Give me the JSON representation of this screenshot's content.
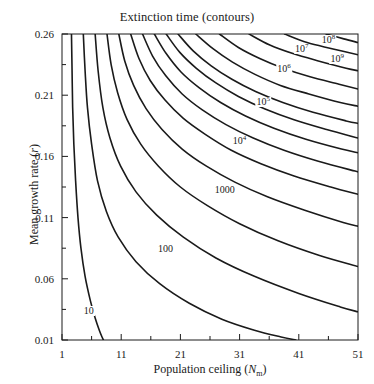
{
  "chart_data": {
    "type": "line",
    "title": "Extinction time (contours)",
    "xlabel": "Population ceiling (Nm)",
    "ylabel": "Mean growth rate (r)",
    "xlim": [
      1,
      51
    ],
    "ylim": [
      0.01,
      0.26
    ],
    "grid": false,
    "legend": "none",
    "xticks": [
      "1",
      "11",
      "21",
      "31",
      "41",
      "51"
    ],
    "xtick_values": [
      1,
      11,
      21,
      31,
      41,
      51
    ],
    "xminor_values": [
      6,
      16,
      26,
      36,
      46
    ],
    "yticks": [
      "0.01",
      "0.06",
      "0.11",
      "0.16",
      "0.21",
      "0.26"
    ],
    "ytick_values": [
      0.01,
      0.06,
      0.11,
      0.16,
      0.21,
      0.26
    ],
    "yminor_values": [
      0.035,
      0.085,
      0.135,
      0.185,
      0.235
    ],
    "contour_levels": [
      "10",
      "100",
      "1000",
      "10^4",
      "10^5",
      "10^6",
      "10^7",
      "10^8",
      "10^9"
    ],
    "series": [
      {
        "name": "10",
        "label": "10",
        "label_sup": "",
        "label_x": 5.5,
        "label_y": 0.0335,
        "points": [
          [
            2.6,
            0.26
          ],
          [
            2.7,
            0.23
          ],
          [
            2.8,
            0.2
          ],
          [
            3.0,
            0.17
          ],
          [
            3.3,
            0.14
          ],
          [
            3.7,
            0.11
          ],
          [
            4.2,
            0.085
          ],
          [
            4.9,
            0.062
          ],
          [
            5.8,
            0.042
          ],
          [
            6.6,
            0.028
          ],
          [
            7.3,
            0.018
          ],
          [
            7.8,
            0.012
          ],
          [
            8.0,
            0.01
          ]
        ]
      },
      {
        "name": "100",
        "label": "100",
        "label_sup": "",
        "label_x": 18.5,
        "label_y": 0.0845,
        "points": [
          [
            4.6,
            0.26
          ],
          [
            4.9,
            0.23
          ],
          [
            5.3,
            0.2
          ],
          [
            6.0,
            0.17
          ],
          [
            7.0,
            0.14
          ],
          [
            8.5,
            0.115
          ],
          [
            10.5,
            0.094
          ],
          [
            13.5,
            0.074
          ],
          [
            17.5,
            0.056
          ],
          [
            22.5,
            0.04
          ],
          [
            28.0,
            0.027
          ],
          [
            33.5,
            0.018
          ],
          [
            38.0,
            0.0125
          ],
          [
            40.5,
            0.01
          ]
        ]
      },
      {
        "name": "1000",
        "label": "1000",
        "label_sup": "",
        "label_x": 28.5,
        "label_y": 0.1325,
        "points": [
          [
            6.6,
            0.26
          ],
          [
            7.1,
            0.23
          ],
          [
            7.9,
            0.2
          ],
          [
            9.1,
            0.175
          ],
          [
            10.9,
            0.152
          ],
          [
            13.5,
            0.131
          ],
          [
            17.0,
            0.112
          ],
          [
            21.5,
            0.094
          ],
          [
            27.0,
            0.077
          ],
          [
            33.5,
            0.062
          ],
          [
            41.0,
            0.048
          ],
          [
            48.0,
            0.037
          ],
          [
            51,
            0.033
          ]
        ]
      },
      {
        "name": "10^4",
        "label": "10",
        "label_sup": "4",
        "label_x": 31.0,
        "label_y": 0.1725,
        "points": [
          [
            8.6,
            0.26
          ],
          [
            9.3,
            0.235
          ],
          [
            10.4,
            0.212
          ],
          [
            12.0,
            0.19
          ],
          [
            14.3,
            0.17
          ],
          [
            17.3,
            0.152
          ],
          [
            21.0,
            0.135
          ],
          [
            25.5,
            0.12
          ],
          [
            31.0,
            0.105
          ],
          [
            37.5,
            0.091
          ],
          [
            44.5,
            0.079
          ],
          [
            51,
            0.07
          ]
        ]
      },
      {
        "name": "10^5",
        "label": "10",
        "label_sup": "5",
        "label_x": 35.0,
        "label_y": 0.2045,
        "points": [
          [
            10.6,
            0.26
          ],
          [
            11.6,
            0.238
          ],
          [
            13.1,
            0.218
          ],
          [
            15.2,
            0.199
          ],
          [
            17.9,
            0.182
          ],
          [
            21.3,
            0.166
          ],
          [
            25.4,
            0.152
          ],
          [
            30.2,
            0.139
          ],
          [
            35.7,
            0.127
          ],
          [
            42.0,
            0.116
          ],
          [
            48.5,
            0.106
          ],
          [
            51,
            0.103
          ]
        ]
      },
      {
        "name": "10^6",
        "label": "10",
        "label_sup": "6",
        "label_x": 38.5,
        "label_y": 0.2315,
        "points": [
          [
            12.6,
            0.26
          ],
          [
            14.0,
            0.24
          ],
          [
            15.9,
            0.222
          ],
          [
            18.4,
            0.206
          ],
          [
            21.5,
            0.191
          ],
          [
            25.2,
            0.178
          ],
          [
            29.6,
            0.165
          ],
          [
            34.6,
            0.154
          ],
          [
            40.2,
            0.144
          ],
          [
            46.4,
            0.135
          ],
          [
            51,
            0.129
          ]
        ]
      },
      {
        "name": "10^7",
        "label": "10",
        "label_sup": "7",
        "label_x": 41.5,
        "label_y": 0.2475,
        "points": [
          [
            14.6,
            0.26
          ],
          [
            16.3,
            0.242
          ],
          [
            18.5,
            0.226
          ],
          [
            21.3,
            0.211
          ],
          [
            24.7,
            0.198
          ],
          [
            28.7,
            0.186
          ],
          [
            33.3,
            0.175
          ],
          [
            38.5,
            0.165
          ],
          [
            44.3,
            0.156
          ],
          [
            50.5,
            0.148
          ],
          [
            51,
            0.1475
          ]
        ]
      },
      {
        "name": "10^8",
        "label": "10",
        "label_sup": "8",
        "label_x": 46.0,
        "label_y": 0.2555,
        "points": [
          [
            16.6,
            0.26
          ],
          [
            18.6,
            0.244
          ],
          [
            21.1,
            0.229
          ],
          [
            24.2,
            0.216
          ],
          [
            27.8,
            0.204
          ],
          [
            32.0,
            0.193
          ],
          [
            36.8,
            0.183
          ],
          [
            42.2,
            0.174
          ],
          [
            48.2,
            0.166
          ],
          [
            51,
            0.163
          ]
        ]
      },
      {
        "name": "10^9",
        "label": "10",
        "label_sup": "9",
        "label_x": 47.5,
        "label_y": 0.2395,
        "points": [
          [
            18.6,
            0.26
          ],
          [
            20.9,
            0.245
          ],
          [
            23.7,
            0.232
          ],
          [
            27.0,
            0.22
          ],
          [
            30.8,
            0.209
          ],
          [
            35.2,
            0.199
          ],
          [
            40.2,
            0.19
          ],
          [
            45.7,
            0.182
          ],
          [
            51,
            0.175
          ]
        ]
      },
      {
        "name": "10^10",
        "label": "",
        "label_sup": "",
        "label_x": -100,
        "label_y": 0,
        "points": [
          [
            20.6,
            0.26
          ],
          [
            23.2,
            0.246
          ],
          [
            26.2,
            0.234
          ],
          [
            29.7,
            0.223
          ],
          [
            33.7,
            0.213
          ],
          [
            38.3,
            0.204
          ],
          [
            43.4,
            0.196
          ],
          [
            49.0,
            0.189
          ],
          [
            51,
            0.187
          ]
        ]
      },
      {
        "name": "10^11",
        "label": "",
        "label_sup": "",
        "label_x": -100,
        "label_y": 0,
        "points": [
          [
            23.6,
            0.26
          ],
          [
            26.5,
            0.248
          ],
          [
            29.8,
            0.237
          ],
          [
            33.6,
            0.227
          ],
          [
            37.9,
            0.218
          ],
          [
            42.7,
            0.211
          ],
          [
            48.0,
            0.204
          ],
          [
            51,
            0.201
          ]
        ]
      },
      {
        "name": "10^12",
        "label": "",
        "label_sup": "",
        "label_x": -100,
        "label_y": 0,
        "points": [
          [
            27.6,
            0.26
          ],
          [
            30.8,
            0.249
          ],
          [
            34.4,
            0.24
          ],
          [
            38.4,
            0.232
          ],
          [
            42.9,
            0.225
          ],
          [
            47.8,
            0.219
          ],
          [
            51,
            0.215
          ]
        ]
      },
      {
        "name": "10^13",
        "label": "",
        "label_sup": "",
        "label_x": -100,
        "label_y": 0,
        "points": [
          [
            32.6,
            0.26
          ],
          [
            36.1,
            0.251
          ],
          [
            40.0,
            0.244
          ],
          [
            44.3,
            0.238
          ],
          [
            49.0,
            0.232
          ],
          [
            51,
            0.23
          ]
        ]
      },
      {
        "name": "10^14",
        "label": "",
        "label_sup": "",
        "label_x": -100,
        "label_y": 0,
        "points": [
          [
            38.6,
            0.26
          ],
          [
            42.4,
            0.253
          ],
          [
            46.6,
            0.248
          ],
          [
            51,
            0.243
          ]
        ]
      },
      {
        "name": "10^15",
        "label": "",
        "label_sup": "",
        "label_x": -100,
        "label_y": 0,
        "points": [
          [
            45.6,
            0.26
          ],
          [
            48.6,
            0.256
          ],
          [
            51,
            0.253
          ]
        ]
      }
    ],
    "colors": {
      "background": "#ffffff",
      "axis": "#1a1a1a",
      "contour": "#1a1a1a"
    }
  }
}
